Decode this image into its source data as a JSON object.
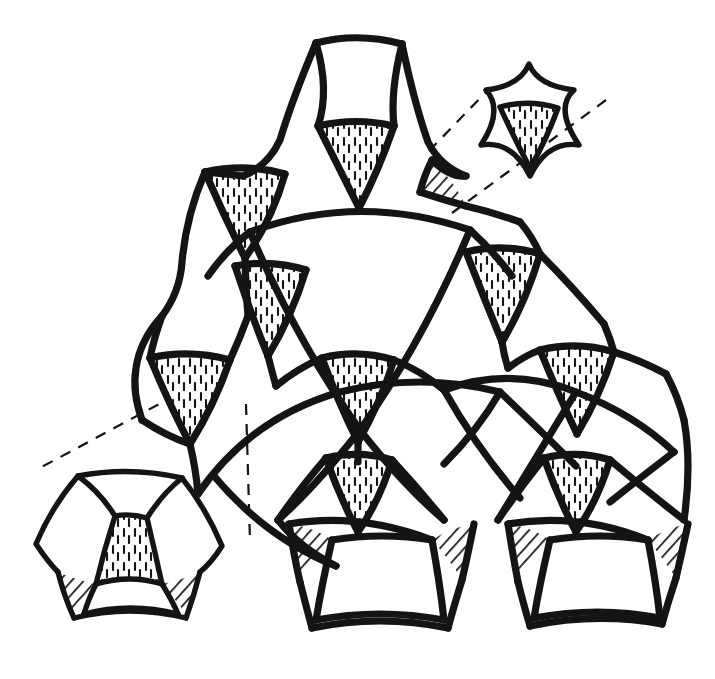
{
  "figure": {
    "title": "Curved pentagonal tiling with magnified insets",
    "background_color": "#ffffff",
    "ink_color": "#141414",
    "canvas": {
      "width": 715,
      "height": 679
    },
    "style": "hand-drawn pen and ink line diagram, black on white",
    "hatch_fills": {
      "interstice_fill": "vertical-dash-hatch",
      "corner_fill": "diagonal-line-hatch"
    }
  },
  "main_cluster": {
    "name": "main-tiling-cluster",
    "description": "Triangular cluster of curved pentagonal tiles meeting at four-pointed star nodes",
    "outline": "M 310 42 C 352 34 398 36 432 46 C 440 96 452 140 470 168 C 432 184 400 200 376 222 C 350 196 322 176 290 164 C 302 128 308 84 310 42 Z",
    "star_nodes": [
      {
        "id": "node-top",
        "cx": 355,
        "cy": 110,
        "r": 62,
        "label": "top apex star"
      },
      {
        "id": "node-upper-left",
        "cx": 243,
        "cy": 195,
        "r": 62,
        "label": "upper left star"
      },
      {
        "id": "node-upper-right",
        "cx": 466,
        "cy": 195,
        "r": 62,
        "label": "upper right star"
      },
      {
        "id": "node-mid-left",
        "cx": 189,
        "cy": 381,
        "r": 62,
        "label": "mid left star"
      },
      {
        "id": "node-mid-center",
        "cx": 357,
        "cy": 381,
        "r": 62,
        "label": "mid center star"
      },
      {
        "id": "node-mid-right",
        "cx": 573,
        "cy": 381,
        "r": 62,
        "label": "mid right star"
      },
      {
        "id": "node-low-center",
        "cx": 357,
        "cy": 500,
        "r": 62,
        "label": "lower center star"
      },
      {
        "id": "node-low-right",
        "cx": 575,
        "cy": 500,
        "r": 62,
        "label": "lower right star"
      }
    ],
    "big_arc_triangle": {
      "id": "central-curved-triangle",
      "description": "Large reuleaux-like region at centre formed by three crossing arcs",
      "vertices": [
        [
          250,
          228
        ],
        [
          470,
          228
        ],
        [
          360,
          430
        ]
      ]
    }
  },
  "insets": [
    {
      "id": "inset-top-right",
      "name": "magnified-star-node",
      "description": "Four pointed concave star tile with hatched inner curved triangle",
      "cx": 528,
      "cy": 118,
      "scale": 1.0,
      "leader_from": [
        432,
        160
      ],
      "leader_to": [
        478,
        96
      ],
      "leader_from2": [
        466,
        216
      ],
      "leader_to2": [
        596,
        110
      ]
    },
    {
      "id": "inset-bottom-left",
      "name": "magnified-tile-triple",
      "description": "Three curved pentagon tiles around a hatched triangle with dark corner wedges",
      "cx": 130,
      "cy": 550,
      "scale": 1.0,
      "leader_from": [
        185,
        398
      ],
      "leader_to": [
        40,
        470
      ],
      "leader_from2": [
        238,
        404
      ],
      "leader_to2": [
        250,
        540
      ]
    }
  ],
  "legend": {
    "vertical_hatch_meaning": "interstitial curved triangle",
    "diagonal_hatch_meaning": "small corner wedge"
  }
}
